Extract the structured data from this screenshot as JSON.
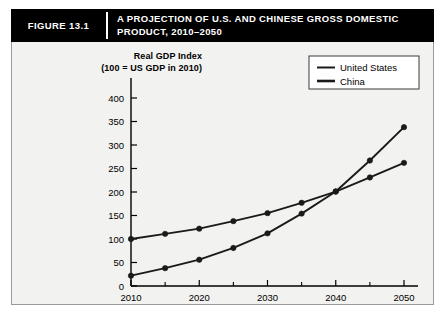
{
  "figure": {
    "number_label": "FIGURE 13.1",
    "title_line_1": "A PROJECTION OF U.S. AND CHINESE GROSS DOMESTIC",
    "title_line_2": "PRODUCT, 2010–2050"
  },
  "axis_title": {
    "line_1": "Real GDP Index",
    "line_2": "(100 = US GDP in 2010)"
  },
  "colors": {
    "title_bar_background": "#000000",
    "title_bar_text": "#ffffff",
    "panel_background": "#f2f2f0",
    "panel_border": "#9a9a96",
    "series_united_states": "#1a1a1a",
    "series_china": "#1a1a1a",
    "axis": "#000000"
  },
  "chart_data": {
    "type": "line",
    "title": "A PROJECTION OF U.S. AND CHINESE GROSS DOMESTIC PRODUCT, 2010–2050",
    "xlabel": "",
    "ylabel": "Real GDP Index (100 = US GDP in 2010)",
    "x": [
      2010,
      2015,
      2020,
      2025,
      2030,
      2035,
      2040,
      2045,
      2050
    ],
    "xlim": [
      2010,
      2050
    ],
    "ylim": [
      0,
      400
    ],
    "grid": false,
    "legend_position": "top-right",
    "x_tick_labels": [
      "2010",
      "2020",
      "2030",
      "2040",
      "2050"
    ],
    "x_tick_values": [
      2010,
      2020,
      2030,
      2040,
      2050
    ],
    "x_minor_tick_values": [
      2015,
      2025,
      2035,
      2045
    ],
    "y_tick_labels": [
      "0",
      "50",
      "100",
      "150",
      "200",
      "250",
      "300",
      "350",
      "400"
    ],
    "y_tick_values": [
      0,
      50,
      100,
      150,
      200,
      250,
      300,
      350,
      400
    ],
    "series": [
      {
        "name": "United States",
        "values": [
          100,
          111,
          122,
          138,
          155,
          177,
          201,
          231,
          262
        ]
      },
      {
        "name": "China",
        "values": [
          22,
          38,
          56,
          81,
          112,
          154,
          201,
          267,
          338
        ]
      }
    ]
  }
}
